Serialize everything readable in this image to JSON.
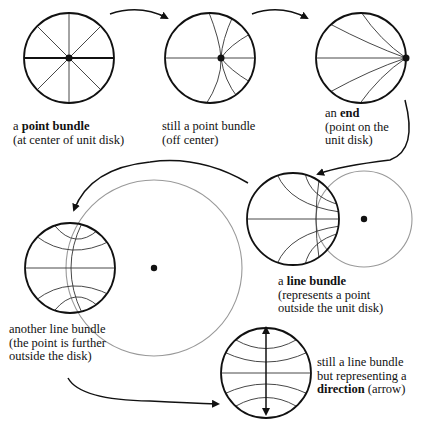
{
  "colors": {
    "ink": "#111111",
    "disk_stroke": "#111111",
    "geodesic": "#333333",
    "guide_circle": "#9a9a9a"
  },
  "panels": [
    {
      "id": "point-center",
      "lines": [
        {
          "pre": "a ",
          "bold": "point bundle",
          "post": ""
        },
        {
          "pre": "(at center of unit disk)",
          "bold": "",
          "post": ""
        }
      ]
    },
    {
      "id": "point-off",
      "lines": [
        {
          "pre": "still a point bundle",
          "bold": "",
          "post": ""
        },
        {
          "pre": "(off center)",
          "bold": "",
          "post": ""
        }
      ]
    },
    {
      "id": "end",
      "lines": [
        {
          "pre": "an ",
          "bold": "end",
          "post": ""
        },
        {
          "pre": "(point on the",
          "bold": "",
          "post": ""
        },
        {
          "pre": "unit disk)",
          "bold": "",
          "post": ""
        }
      ]
    },
    {
      "id": "line-bundle",
      "lines": [
        {
          "pre": "a ",
          "bold": "line bundle",
          "post": ""
        },
        {
          "pre": "(represents a point",
          "bold": "",
          "post": ""
        },
        {
          "pre": "outside the unit disk)",
          "bold": "",
          "post": ""
        }
      ]
    },
    {
      "id": "line-bundle-far",
      "lines": [
        {
          "pre": "another line bundle",
          "bold": "",
          "post": ""
        },
        {
          "pre": "(the point is further",
          "bold": "",
          "post": ""
        },
        {
          "pre": "outside the disk)",
          "bold": "",
          "post": ""
        }
      ]
    },
    {
      "id": "direction",
      "lines": [
        {
          "pre": "still a line bundle",
          "bold": "",
          "post": ""
        },
        {
          "pre": "but representing a",
          "bold": "",
          "post": ""
        },
        {
          "pre": "",
          "bold": "direction",
          "post": " (arrow)"
        }
      ]
    }
  ]
}
